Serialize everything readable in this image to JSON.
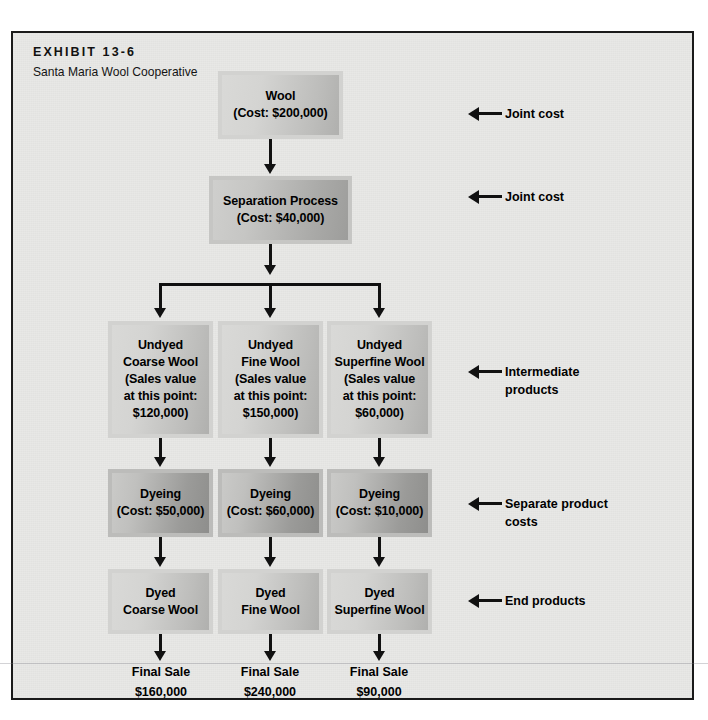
{
  "exhibit": {
    "label": "EXHIBIT 13-6",
    "subtitle": "Santa Maria Wool Cooperative"
  },
  "nodes": {
    "wool": {
      "title": "Wool",
      "detail": "(Cost: $200,000)"
    },
    "separation": {
      "title": "Separation Process",
      "detail": "(Cost: $40,000)"
    },
    "undyed_coarse": {
      "l1": "Undyed",
      "l2": "Coarse Wool",
      "l3": "(Sales value",
      "l4": "at this point:",
      "l5": "$120,000)"
    },
    "undyed_fine": {
      "l1": "Undyed",
      "l2": "Fine Wool",
      "l3": "(Sales value",
      "l4": "at this point:",
      "l5": "$150,000)"
    },
    "undyed_superfine": {
      "l1": "Undyed",
      "l2": "Superfine Wool",
      "l3": "(Sales value",
      "l4": "at this point:",
      "l5": "$60,000)"
    },
    "dyeing_coarse": {
      "title": "Dyeing",
      "detail": "(Cost: $50,000)"
    },
    "dyeing_fine": {
      "title": "Dyeing",
      "detail": "(Cost: $60,000)"
    },
    "dyeing_superfine": {
      "title": "Dyeing",
      "detail": "(Cost: $10,000)"
    },
    "dyed_coarse": {
      "l1": "Dyed",
      "l2": "Coarse Wool"
    },
    "dyed_fine": {
      "l1": "Dyed",
      "l2": "Fine Wool"
    },
    "dyed_superfine": {
      "l1": "Dyed",
      "l2": "Superfine Wool"
    }
  },
  "final_sales": [
    {
      "label": "Final Sale",
      "amount": "$160,000"
    },
    {
      "label": "Final Sale",
      "amount": "$240,000"
    },
    {
      "label": "Final Sale",
      "amount": "$90,000"
    }
  ],
  "annotations": [
    {
      "line1": "Joint cost",
      "line2": ""
    },
    {
      "line1": "Joint cost",
      "line2": ""
    },
    {
      "line1": "Intermediate",
      "line2": "products"
    },
    {
      "line1": "Separate product",
      "line2": "costs"
    },
    {
      "line1": "End products",
      "line2": ""
    }
  ],
  "colors": {
    "frame_bg": "#e8e8e6",
    "frame_border": "#1a1a1a",
    "ink": "#111111",
    "box_pale": "#d4d4d2",
    "box_mid": "#c6c6c4",
    "box_dark": "#b0b0ae"
  }
}
